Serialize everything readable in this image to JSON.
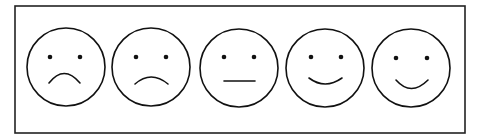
{
  "scale": {
    "title": "Facial expression rating scale",
    "colors": {
      "stroke": "#111111",
      "frame": "#222222",
      "background": "#ffffff"
    },
    "frame": {
      "x": 15,
      "y": 6,
      "width": 450,
      "height": 127
    },
    "faces": [
      {
        "id": "very-sad",
        "label": "Very sad",
        "cx": 66,
        "cy": 67,
        "r": 39,
        "eyes": [
          [
            50,
            57
          ],
          [
            80,
            57
          ]
        ],
        "mouth": "M49 83 Q64 64 80 83"
      },
      {
        "id": "sad",
        "label": "Sad",
        "cx": 151,
        "cy": 67,
        "r": 39,
        "eyes": [
          [
            136,
            57
          ],
          [
            166,
            57
          ]
        ],
        "mouth": "M135 84 Q151 70 168 84"
      },
      {
        "id": "neutral",
        "label": "Neutral",
        "cx": 239,
        "cy": 68,
        "r": 39,
        "eyes": [
          [
            224,
            57
          ],
          [
            254,
            57
          ]
        ],
        "mouth": "M224 81 L255 81"
      },
      {
        "id": "happy",
        "label": "Happy",
        "cx": 325,
        "cy": 68,
        "r": 39,
        "eyes": [
          [
            311,
            57
          ],
          [
            341,
            57
          ]
        ],
        "mouth": "M309 78 Q325 90 342 78"
      },
      {
        "id": "very-happy",
        "label": "Very happy",
        "cx": 411,
        "cy": 68,
        "r": 39,
        "eyes": [
          [
            396,
            58
          ],
          [
            427,
            58
          ]
        ],
        "mouth": "M396 80 Q411 97 428 80"
      }
    ]
  }
}
